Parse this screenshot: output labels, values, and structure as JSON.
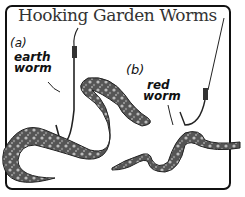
{
  "title": "Hooking Garden Worms",
  "panels": [
    {
      "letter": "(a)",
      "label_line1": "earth",
      "label_line2": "worm"
    },
    {
      "letter": "(b)",
      "label_line1": "red",
      "label_line2": "worm"
    }
  ]
}
